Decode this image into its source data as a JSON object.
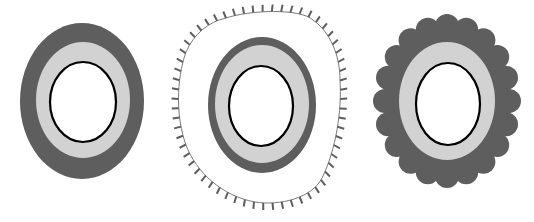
{
  "figures": [
    {
      "id": "plain",
      "outer_style": "smooth",
      "dark": "#5e5e5e",
      "light": "#d2d2d2",
      "inner": "#ffffff",
      "outline": "#000000"
    },
    {
      "id": "ticked",
      "outer_style": "thin-outline-with-ticks",
      "dark": "#5e5e5e",
      "light": "#d2d2d2",
      "inner": "#ffffff",
      "outline": "#000000",
      "tick_color": "#5e5e5e"
    },
    {
      "id": "scalloped",
      "outer_style": "scalloped",
      "dark": "#5e5e5e",
      "light": "#d2d2d2",
      "inner": "#ffffff",
      "outline": "#000000"
    }
  ]
}
